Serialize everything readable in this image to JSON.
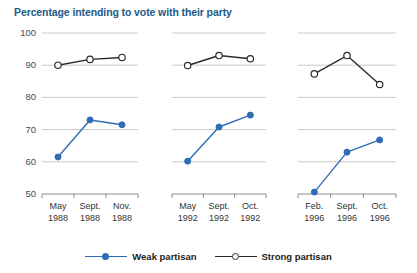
{
  "chart_data": {
    "type": "line",
    "title": "Percentage intending to vote with their party",
    "xlabel": "",
    "ylabel": "",
    "ylim": [
      50,
      100
    ],
    "yticks": [
      50,
      60,
      70,
      80,
      90,
      100
    ],
    "grid": true,
    "legend_position": "bottom",
    "panels": [
      {
        "name": "1988",
        "categories": [
          "May\n1988",
          "Sept.\n1988",
          "Nov.\n1988"
        ],
        "tick_labels": [
          {
            "line1": "May",
            "line2": "1988"
          },
          {
            "line1": "Sept.",
            "line2": "1988"
          },
          {
            "line1": "Nov.",
            "line2": "1988"
          }
        ],
        "series": [
          {
            "name": "Weak partisan",
            "values": [
              61.5,
              73.0,
              71.5
            ]
          },
          {
            "name": "Strong partisan",
            "values": [
              90.0,
              91.8,
              92.4
            ]
          }
        ]
      },
      {
        "name": "1992",
        "categories": [
          "May\n1992",
          "Sept.\n1992",
          "Oct.\n1992"
        ],
        "tick_labels": [
          {
            "line1": "May",
            "line2": "1992"
          },
          {
            "line1": "Sept.",
            "line2": "1992"
          },
          {
            "line1": "Oct.",
            "line2": "1992"
          }
        ],
        "series": [
          {
            "name": "Weak partisan",
            "values": [
              60.2,
              70.8,
              74.5
            ]
          },
          {
            "name": "Strong partisan",
            "values": [
              89.9,
              93.0,
              92.0
            ]
          }
        ]
      },
      {
        "name": "1996",
        "categories": [
          "Feb.\n1996",
          "Sept.\n1996",
          "Oct.\n1996"
        ],
        "tick_labels": [
          {
            "line1": "Feb.",
            "line2": "1996"
          },
          {
            "line1": "Sept.",
            "line2": "1996"
          },
          {
            "line1": "Oct.",
            "line2": "1996"
          }
        ],
        "series": [
          {
            "name": "Weak partisan",
            "values": [
              50.6,
              63.0,
              66.8
            ]
          },
          {
            "name": "Strong partisan",
            "values": [
              87.3,
              93.0,
              84.0
            ]
          }
        ]
      }
    ],
    "legend": [
      {
        "label": "Weak partisan",
        "color": "#2e6db4",
        "marker": "filled-circle"
      },
      {
        "label": "Strong partisan",
        "color": "#2b2b2b",
        "marker": "open-circle"
      }
    ],
    "colors": {
      "weak_partisan": "#2e6db4",
      "strong_partisan": "#2b2b2b",
      "title": "#245a88",
      "gridline": "#c9c9c9",
      "axis": "#8c8c8c",
      "background": "#ffffff"
    }
  }
}
